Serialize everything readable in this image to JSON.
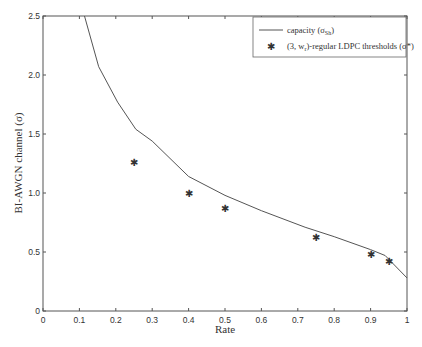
{
  "chart_data": {
    "type": "line",
    "title": "",
    "xlabel": "Rate",
    "ylabel": "BI-AWGN channel (σ)",
    "xlim": [
      0,
      1
    ],
    "ylim": [
      0,
      2.5
    ],
    "x_ticks": [
      "0",
      "0.1",
      "0.2",
      "0.3",
      "0.4",
      "0.5",
      "0.6",
      "0.7",
      "0.8",
      "0.9",
      "1"
    ],
    "y_ticks": [
      "0",
      "0.5",
      "1.0",
      "1.5",
      "2.0",
      "2.5"
    ],
    "grid": false,
    "legend_position": "upper right",
    "series": [
      {
        "name": "capacity (σ_Sh)",
        "kind": "line",
        "color": "#555555",
        "x": [
          0.114,
          0.153,
          0.205,
          0.255,
          0.3,
          0.4,
          0.5,
          0.6,
          0.72,
          0.8,
          0.9,
          0.94,
          1.0
        ],
        "y": [
          2.5,
          2.07,
          1.77,
          1.54,
          1.44,
          1.14,
          0.98,
          0.85,
          0.71,
          0.63,
          0.52,
          0.47,
          0.28
        ]
      },
      {
        "name": "(3, w_r)-regular LDPC thresholds (σ*)",
        "kind": "scatter",
        "marker": "asterisk",
        "color": "#222222",
        "x": [
          0.25,
          0.4,
          0.5,
          0.75,
          0.9,
          0.95
        ],
        "y": [
          1.26,
          1.0,
          0.87,
          0.62,
          0.48,
          0.42
        ]
      }
    ]
  },
  "legend": {
    "capacity_label": "capacity (σ",
    "capacity_sub": "Sh",
    "capacity_close": ")",
    "ldpc_label_a": "(3, w",
    "ldpc_sub": "r",
    "ldpc_label_b": ")-regular LDPC thresholds (σ*)"
  }
}
